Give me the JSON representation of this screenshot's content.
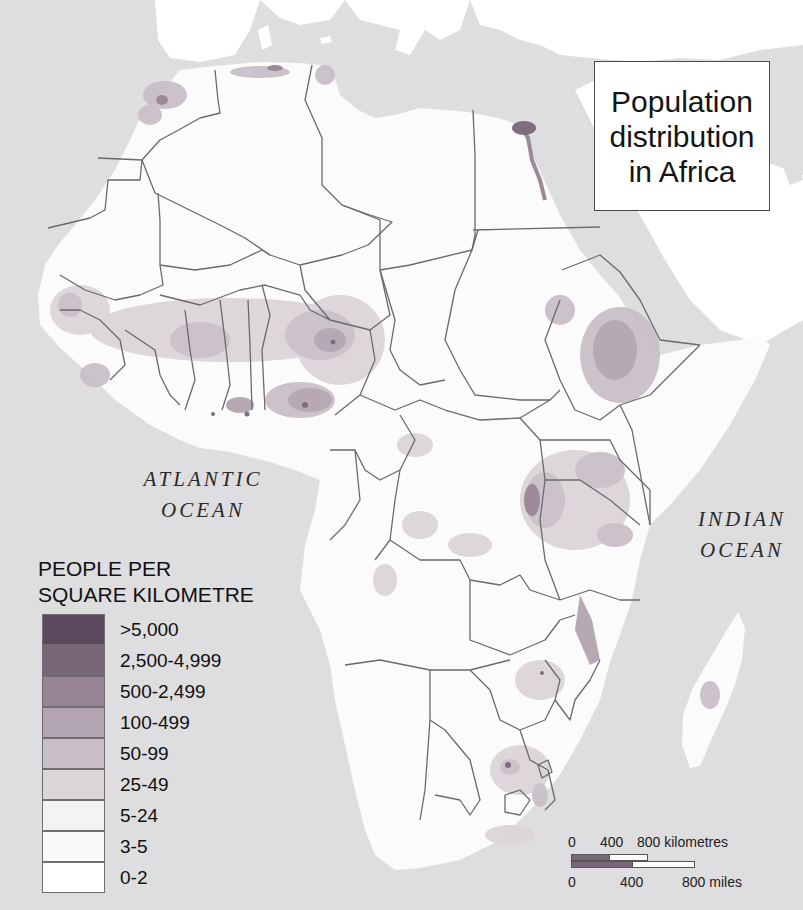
{
  "title": {
    "lines": [
      "Population",
      "distribution",
      "in Africa"
    ]
  },
  "oceans": {
    "atlantic": [
      "ATLANTIC",
      "OCEAN"
    ],
    "indian": [
      "INDIAN",
      "OCEAN"
    ]
  },
  "legend": {
    "title_lines": [
      "PEOPLE PER",
      "SQUARE KILOMETRE"
    ],
    "items": [
      {
        "label": ">5,000",
        "color": "#5b4a5e"
      },
      {
        "label": "2,500-4,999",
        "color": "#7a6679"
      },
      {
        "label": "500-2,499",
        "color": "#978595"
      },
      {
        "label": "100-499",
        "color": "#b3a5b1"
      },
      {
        "label": "50-99",
        "color": "#c9bfc8"
      },
      {
        "label": "25-49",
        "color": "#dcd6db"
      },
      {
        "label": "5-24",
        "color": "#f4f2f3"
      },
      {
        "label": "3-5",
        "color": "#fbfafb"
      },
      {
        "label": "0-2",
        "color": "#ffffff"
      }
    ]
  },
  "scale_bar": {
    "km_labels": [
      "0",
      "400",
      "800 kilometres"
    ],
    "mile_labels": [
      "0",
      "400",
      "800 miles"
    ]
  },
  "colors": {
    "sea": "#dedddf",
    "land": "#fbfbfb",
    "border": "#6a6a6a"
  }
}
